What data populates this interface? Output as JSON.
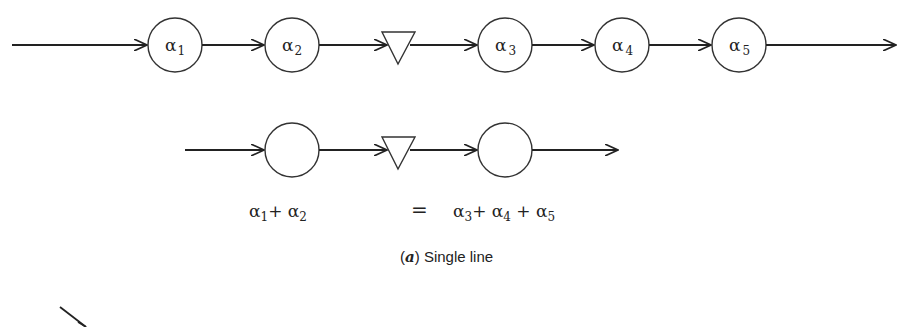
{
  "diagram": {
    "top_row": {
      "nodes": [
        {
          "type": "circle",
          "symbol": "α",
          "subscript": "1"
        },
        {
          "type": "circle",
          "symbol": "α",
          "subscript": "2"
        },
        {
          "type": "triangle",
          "symbol": "",
          "subscript": ""
        },
        {
          "type": "circle",
          "symbol": "α",
          "subscript": "3"
        },
        {
          "type": "circle",
          "symbol": "α",
          "subscript": "4"
        },
        {
          "type": "circle",
          "symbol": "α",
          "subscript": "5"
        }
      ]
    },
    "equivalent_row": {
      "nodes": [
        {
          "type": "circle",
          "label": ""
        },
        {
          "type": "triangle",
          "label": ""
        },
        {
          "type": "circle",
          "label": ""
        }
      ],
      "left_label": {
        "a": "α",
        "a_sub": "1",
        "plus1": "+ ",
        "b": "α",
        "b_sub": "2"
      },
      "equals": "=",
      "right_label": {
        "a": "α",
        "a_sub": "3",
        "plus1": "+ ",
        "b": "α",
        "b_sub": "4",
        "plus2": " + ",
        "c": "α",
        "c_sub": "5"
      }
    },
    "caption": {
      "letter": "a",
      "open_paren": "(",
      "close_paren": ")",
      "text": " Single line"
    }
  }
}
